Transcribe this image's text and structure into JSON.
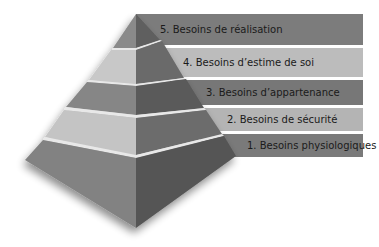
{
  "diagram": {
    "type": "pyramid",
    "levels": [
      {
        "rank": 5,
        "label": "5. Besoins de réalisation"
      },
      {
        "rank": 4,
        "label": "4. Besoins d’estime de soi"
      },
      {
        "rank": 3,
        "label": "3. Besoins d’appartenance"
      },
      {
        "rank": 2,
        "label": "2. Besoins de sécurité"
      },
      {
        "rank": 1,
        "label": "1. Besoins physiologiques"
      }
    ],
    "colors": {
      "band_dark": "#7a7a7a",
      "band_light": "#b8b8b8",
      "face_left_dark": "#858585",
      "face_left_light": "#c6c6c6",
      "face_right_dark": "#5c5c5c",
      "face_right_light": "#6e6e6e",
      "separator": "#e6e6e6"
    }
  }
}
